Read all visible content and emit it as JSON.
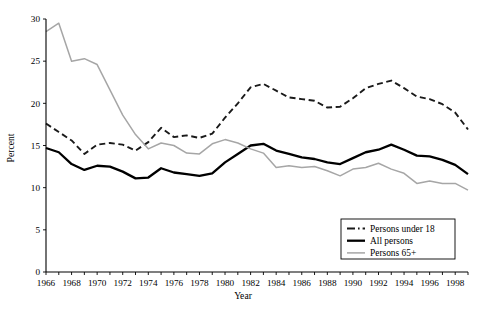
{
  "chart_data": {
    "type": "line",
    "title": "",
    "xlabel": "Year",
    "ylabel": "Percent",
    "xlim": [
      1966,
      1999
    ],
    "ylim": [
      0,
      30
    ],
    "yticks": [
      0,
      5,
      10,
      15,
      20,
      25,
      30
    ],
    "xticks": [
      1966,
      1968,
      1970,
      1972,
      1974,
      1976,
      1978,
      1980,
      1982,
      1984,
      1986,
      1988,
      1990,
      1992,
      1994,
      1996,
      1998
    ],
    "x_tick_labels": [
      "1966",
      "1968",
      "1970",
      "1972",
      "1974",
      "1976",
      "1978",
      "1980",
      "1982",
      "1984",
      "1986",
      "1988",
      "1990",
      "1992",
      "1994",
      "1996",
      "1998"
    ],
    "y_tick_labels": [
      "0",
      "5",
      "10",
      "15",
      "20",
      "25",
      "30"
    ],
    "grid": false,
    "legend_position": "bottom-right",
    "x": [
      1966,
      1967,
      1968,
      1969,
      1970,
      1971,
      1972,
      1973,
      1974,
      1975,
      1976,
      1977,
      1978,
      1979,
      1980,
      1981,
      1982,
      1983,
      1984,
      1985,
      1986,
      1987,
      1988,
      1989,
      1990,
      1991,
      1992,
      1993,
      1994,
      1995,
      1996,
      1997,
      1998,
      1999
    ],
    "series": [
      {
        "name": "Persons under 18",
        "style": "dashed",
        "color": "#1a1a1a",
        "width": 1.9,
        "values": [
          17.6,
          16.6,
          15.6,
          14.0,
          15.1,
          15.3,
          15.1,
          14.4,
          15.4,
          17.1,
          16.0,
          16.2,
          15.9,
          16.4,
          18.3,
          20.0,
          21.9,
          22.3,
          21.5,
          20.7,
          20.5,
          20.3,
          19.5,
          19.6,
          20.6,
          21.8,
          22.3,
          22.7,
          21.8,
          20.8,
          20.5,
          19.9,
          18.9,
          16.9
        ]
      },
      {
        "name": "All persons",
        "style": "solid",
        "color": "#000000",
        "width": 2.3,
        "values": [
          14.7,
          14.2,
          12.8,
          12.1,
          12.6,
          12.5,
          11.9,
          11.1,
          11.2,
          12.3,
          11.8,
          11.6,
          11.4,
          11.7,
          13.0,
          14.0,
          15.0,
          15.2,
          14.4,
          14.0,
          13.6,
          13.4,
          13.0,
          12.8,
          13.5,
          14.2,
          14.5,
          15.1,
          14.5,
          13.8,
          13.7,
          13.3,
          12.7,
          11.6
        ]
      },
      {
        "name": "Persons 65+",
        "style": "solid",
        "color": "#a6a6a6",
        "width": 1.5,
        "values": [
          28.5,
          29.5,
          25.0,
          25.3,
          24.6,
          21.6,
          18.6,
          16.3,
          14.6,
          15.3,
          15.0,
          14.1,
          14.0,
          15.2,
          15.7,
          15.3,
          14.6,
          14.1,
          12.4,
          12.6,
          12.4,
          12.5,
          12.0,
          11.4,
          12.2,
          12.4,
          12.9,
          12.2,
          11.7,
          10.5,
          10.8,
          10.5,
          10.5,
          9.7
        ]
      }
    ]
  },
  "legend": {
    "items": [
      {
        "label": "Persons under 18",
        "swatch": "dashed-line-swatch"
      },
      {
        "label": "All persons",
        "swatch": "solid-black-line-swatch"
      },
      {
        "label": "Persons 65+",
        "swatch": "solid-gray-line-swatch"
      }
    ]
  },
  "colors": {
    "under18": "#1a1a1a",
    "all": "#000000",
    "over65": "#a6a6a6",
    "axis": "#000000",
    "background": "#ffffff"
  }
}
